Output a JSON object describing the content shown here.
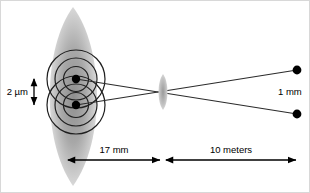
{
  "figure": {
    "kind": "optics-ray-diagram",
    "background_color": "#ffffff",
    "line_color": "#2b2b2b",
    "dot_color": "#000000",
    "lens_fill_light": "#e4e4e4",
    "lens_fill_dark": "#8e8e8e"
  },
  "labels": {
    "object_separation": "2 µm",
    "image_separation": "1 mm",
    "distance_near": "17 mm",
    "distance_far": "10 meters"
  },
  "annotations": {
    "left_lens_name": "eye-lens-shape",
    "right_lens_name": "objective-lens-shape",
    "source_dot_top": "source-point-upper",
    "source_dot_bottom": "source-point-lower",
    "image_dot_top": "image-point-upper",
    "image_dot_bottom": "image-point-lower"
  },
  "geometry": {
    "source_top": {
      "x": 76,
      "y": 79
    },
    "source_bottom": {
      "x": 76,
      "y": 105
    },
    "crossing_point": {
      "x": 163,
      "y": 92
    },
    "image_top": {
      "x": 297,
      "y": 70
    },
    "image_bottom": {
      "x": 297,
      "y": 114
    },
    "scale_bar_near": {
      "x1": 68,
      "x2": 160,
      "y": 160
    },
    "scale_bar_far": {
      "x1": 166,
      "x2": 296,
      "y": 160
    },
    "micron_bar": {
      "x": 34,
      "y1": 79,
      "y2": 105
    }
  }
}
